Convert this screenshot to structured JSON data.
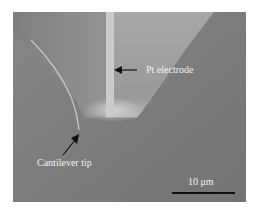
{
  "figure": {
    "type": "SEM micrograph",
    "annotations": [
      {
        "id": "pt_electrode",
        "text": "Pt electrode"
      },
      {
        "id": "cantilever_tip",
        "text": "Cantilever tip"
      }
    ],
    "scale_bar": {
      "label": "10 μm",
      "color": "#111111"
    },
    "colors": {
      "background": "#7a7a7a",
      "pyramid_face": "#9d9d9d",
      "electrode": "#c4c4c4",
      "label_text": "#f2f2f2"
    }
  }
}
